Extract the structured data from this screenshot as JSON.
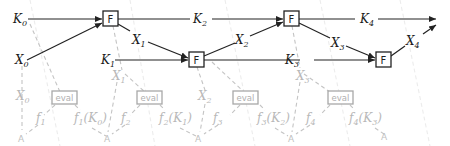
{
  "diagram": {
    "type": "key-rolling cascade",
    "main_row": {
      "key_inputs": [
        {
          "base": "K",
          "sub": "0"
        },
        {
          "base": "K",
          "sub": "1"
        },
        {
          "base": "K",
          "sub": "2"
        },
        {
          "base": "K",
          "sub": "3"
        },
        {
          "base": "K",
          "sub": "4"
        }
      ],
      "x_labels": [
        {
          "base": "X",
          "sub": "0"
        },
        {
          "base": "X",
          "sub": "1"
        },
        {
          "base": "X",
          "sub": "2"
        },
        {
          "base": "X",
          "sub": "3"
        },
        {
          "base": "X",
          "sub": "4"
        }
      ],
      "function_boxes": [
        "F",
        "F",
        "F",
        "F"
      ]
    },
    "lower_row": {
      "x_labels": [
        {
          "base": "X",
          "sub": "0"
        },
        {
          "base": "X",
          "sub": "1"
        },
        {
          "base": "X",
          "sub": "2"
        },
        {
          "base": "X",
          "sub": "3"
        }
      ],
      "eval_label": "eval",
      "f_labels": [
        {
          "base": "f",
          "sub": "1"
        },
        {
          "base": "f",
          "sub": "2"
        },
        {
          "base": "f",
          "sub": "3"
        },
        {
          "base": "f",
          "sub": "4"
        }
      ],
      "f_of_k_labels": [
        {
          "fsub": "1",
          "ksub": "0"
        },
        {
          "fsub": "2",
          "ksub": "1"
        },
        {
          "fsub": "3",
          "ksub": "2"
        },
        {
          "fsub": "4",
          "ksub": "3"
        }
      ],
      "adversary_mark": "A"
    }
  }
}
